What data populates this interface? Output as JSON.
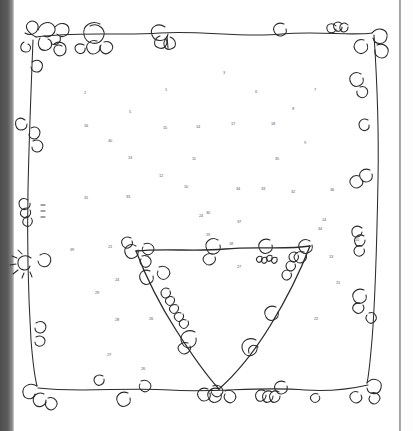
{
  "artwork": {
    "title": "Hand-drawn doodle frame with inner triangle and numbered dots",
    "medium": "pen sketch",
    "ink_color": "#2b2b2b",
    "paper_color": "#ffffff",
    "page_edge_color": "#545454",
    "spine_shadow_color": "#4e4e4e"
  },
  "frame": {
    "label": "outer wavy rectangle border",
    "stroke": "#2b2b2b",
    "decoration": "spirals, curls and flower clusters at corners and along edges"
  },
  "triangle": {
    "label": "inner downward-pointing triangle",
    "stroke": "#2b2b2b",
    "decoration": "spirals, loops and bead clusters along all three edges",
    "vertices": [
      "top-left",
      "top-right",
      "bottom-apex"
    ]
  },
  "dots": [
    {
      "n": "3",
      "x": 223,
      "y": 71
    },
    {
      "n": "2",
      "x": 84,
      "y": 91
    },
    {
      "n": "1",
      "x": 165,
      "y": 88
    },
    {
      "n": "6",
      "x": 255,
      "y": 90
    },
    {
      "n": "7",
      "x": 314,
      "y": 88
    },
    {
      "n": "5",
      "x": 129,
      "y": 110
    },
    {
      "n": "8",
      "x": 292,
      "y": 107
    },
    {
      "n": "16",
      "x": 84,
      "y": 124
    },
    {
      "n": "15",
      "x": 163,
      "y": 126
    },
    {
      "n": "14",
      "x": 196,
      "y": 125
    },
    {
      "n": "17",
      "x": 231,
      "y": 122
    },
    {
      "n": "18",
      "x": 271,
      "y": 122
    },
    {
      "n": "40",
      "x": 108,
      "y": 139
    },
    {
      "n": "9",
      "x": 304,
      "y": 141
    },
    {
      "n": "13",
      "x": 128,
      "y": 156
    },
    {
      "n": "11",
      "x": 192,
      "y": 157
    },
    {
      "n": "35",
      "x": 275,
      "y": 157
    },
    {
      "n": "12",
      "x": 159,
      "y": 174
    },
    {
      "n": "10",
      "x": 184,
      "y": 185
    },
    {
      "n": "31",
      "x": 84,
      "y": 196
    },
    {
      "n": "33",
      "x": 126,
      "y": 195
    },
    {
      "n": "34",
      "x": 236,
      "y": 187
    },
    {
      "n": "33",
      "x": 261,
      "y": 187
    },
    {
      "n": "32",
      "x": 291,
      "y": 190
    },
    {
      "n": "36",
      "x": 330,
      "y": 188
    },
    {
      "n": "30",
      "x": 206,
      "y": 211
    },
    {
      "n": "37",
      "x": 237,
      "y": 220
    },
    {
      "n": "14",
      "x": 322,
      "y": 218
    },
    {
      "n": "19",
      "x": 206,
      "y": 233
    },
    {
      "n": "10",
      "x": 355,
      "y": 238
    },
    {
      "n": "21",
      "x": 108,
      "y": 245
    },
    {
      "n": "39",
      "x": 70,
      "y": 248
    },
    {
      "n": "18",
      "x": 229,
      "y": 242
    },
    {
      "n": "27",
      "x": 237,
      "y": 265
    },
    {
      "n": "44",
      "x": 318,
      "y": 227
    },
    {
      "n": "13",
      "x": 329,
      "y": 255
    },
    {
      "n": "24",
      "x": 115,
      "y": 278
    },
    {
      "n": "21",
      "x": 336,
      "y": 281
    },
    {
      "n": "29",
      "x": 95,
      "y": 291
    },
    {
      "n": "28",
      "x": 115,
      "y": 318
    },
    {
      "n": "26",
      "x": 149,
      "y": 317
    },
    {
      "n": "22",
      "x": 314,
      "y": 317
    },
    {
      "n": "27",
      "x": 107,
      "y": 353
    },
    {
      "n": "26",
      "x": 141,
      "y": 367
    },
    {
      "n": "24",
      "x": 199,
      "y": 214
    }
  ]
}
